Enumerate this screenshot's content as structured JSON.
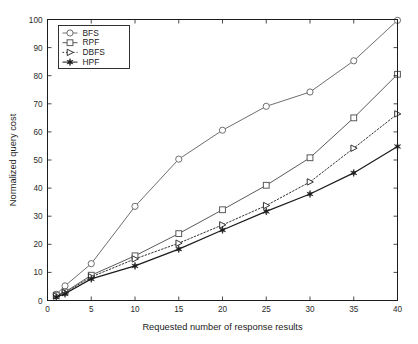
{
  "figure": {
    "background_color": "#ffffff",
    "plot_border_color": "#1c1c1c"
  },
  "chart_data": {
    "type": "line",
    "title": "",
    "xlabel": "Requested number of response results",
    "ylabel": "Normalized query cost",
    "xlim": [
      0,
      40
    ],
    "ylim": [
      0,
      100
    ],
    "xticks": [
      0,
      5,
      10,
      15,
      20,
      25,
      30,
      35,
      40
    ],
    "yticks": [
      0,
      10,
      20,
      30,
      40,
      50,
      60,
      70,
      80,
      90,
      100
    ],
    "grid": false,
    "legend_position": "upper-left",
    "x": [
      1,
      2,
      5,
      10,
      15,
      20,
      25,
      30,
      35,
      40
    ],
    "series": [
      {
        "name": "BFS",
        "marker": "circle-open",
        "linestyle": "solid",
        "color": "#6e6e6e",
        "values": [
          2.2,
          5.2,
          13.1,
          33.5,
          50.3,
          60.6,
          69.1,
          74.2,
          85.3,
          99.7
        ]
      },
      {
        "name": "RPF",
        "marker": "square-open",
        "linestyle": "solid",
        "color": "#5a5a5a",
        "values": [
          1.9,
          3.0,
          9.0,
          15.9,
          23.8,
          32.3,
          41.0,
          50.8,
          65.0,
          80.5
        ]
      },
      {
        "name": "DBFS",
        "marker": "triangle-right-open",
        "linestyle": "dotted",
        "color": "#333333",
        "values": [
          1.6,
          2.8,
          8.4,
          14.8,
          20.4,
          26.9,
          33.8,
          42.2,
          54.2,
          66.4
        ]
      },
      {
        "name": "HPF",
        "marker": "star-filled",
        "linestyle": "solid",
        "color": "#1c1c1c",
        "values": [
          1.2,
          2.4,
          7.7,
          12.3,
          18.3,
          25.1,
          31.7,
          37.9,
          45.4,
          54.8
        ]
      }
    ]
  },
  "legend": {
    "entries": [
      {
        "label": "BFS"
      },
      {
        "label": "RPF"
      },
      {
        "label": "DBFS"
      },
      {
        "label": "HPF"
      }
    ]
  },
  "axis_labels": {
    "x_title": "Requested number of response results",
    "y_title": "Normalized query cost"
  }
}
